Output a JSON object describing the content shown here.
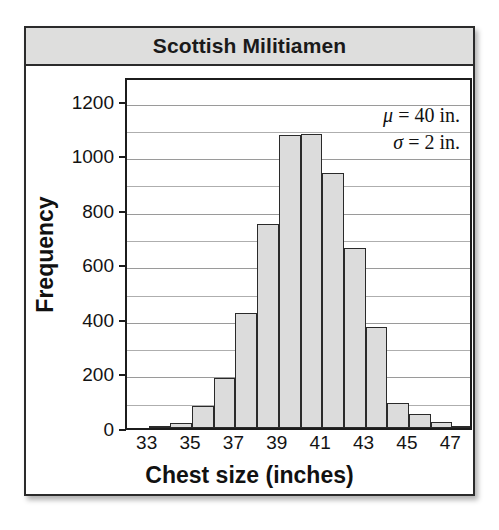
{
  "figure": {
    "title": "Scottish Militiamen"
  },
  "chart_data": {
    "type": "bar",
    "title": "Scottish Militiamen",
    "xlabel": "Chest size (inches)",
    "ylabel": "Frequency",
    "xlim": [
      32,
      48
    ],
    "ylim": [
      0,
      1290
    ],
    "grid": true,
    "grid_interval": 100,
    "bin_width": 1,
    "categories": [
      33,
      34,
      35,
      36,
      37,
      38,
      39,
      40,
      41,
      42,
      43,
      44,
      45,
      46,
      47
    ],
    "values": [
      3,
      18,
      81,
      185,
      420,
      749,
      1073,
      1079,
      934,
      658,
      370,
      92,
      50,
      21,
      4
    ],
    "x_ticks": [
      33,
      35,
      37,
      39,
      41,
      43,
      45,
      47
    ],
    "y_ticks": [
      0,
      200,
      400,
      600,
      800,
      1000,
      1200
    ],
    "annotations": [
      {
        "symbol": "μ",
        "text": " = 40 in."
      },
      {
        "symbol": "σ",
        "text": " = 2 in."
      }
    ],
    "colors": {
      "bar_fill": "#dcdcdc",
      "bar_stroke": "#2a2a2a",
      "grid": "#aeaeae",
      "axis": "#1c1c1c",
      "title_bar": "#dededd",
      "text": "#111111"
    }
  }
}
